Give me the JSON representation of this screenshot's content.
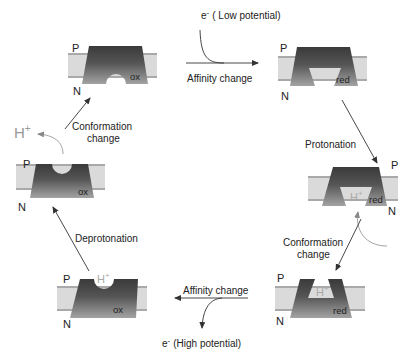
{
  "diagram": {
    "type": "cycle",
    "sides": {
      "top": "P",
      "bottom": "N"
    },
    "states": [
      {
        "id": "s1",
        "redox": "ox",
        "cavity": "open-N",
        "proton": ""
      },
      {
        "id": "s2",
        "redox": "red",
        "cavity": "open-N-wide",
        "proton": ""
      },
      {
        "id": "s3",
        "redox": "red",
        "cavity": "open-N-wide",
        "proton": "H+"
      },
      {
        "id": "s4",
        "redox": "red",
        "cavity": "open-P",
        "proton": "H+"
      },
      {
        "id": "s5",
        "redox": "ox",
        "cavity": "open-P",
        "proton": "H+"
      },
      {
        "id": "s6",
        "redox": "ox",
        "cavity": "open-P",
        "proton": ""
      }
    ],
    "steps": [
      {
        "from": "s1",
        "to": "s2",
        "label": "Affinity change",
        "input": "e⁻ ( Low potential)"
      },
      {
        "from": "s2",
        "to": "s3",
        "label": "Protonation"
      },
      {
        "from": "s3",
        "to": "s4",
        "label_line1": "Conformation",
        "label_line2": "change"
      },
      {
        "from": "s4",
        "to": "s5",
        "label": "Affinity change",
        "output": "e⁻ (High potential)"
      },
      {
        "from": "s5",
        "to": "s6",
        "label": "Deprotonation"
      },
      {
        "from": "s6",
        "to": "s1",
        "label_line1": "Conformation",
        "label_line2": "change",
        "output": "H+"
      }
    ]
  },
  "labels": {
    "P": "P",
    "N": "N",
    "ox": "ox",
    "red": "red",
    "H": "H",
    "plus": "+",
    "e": "e",
    "minus": "-",
    "low_potential": "( Low potential)",
    "high_potential": "(High potential)",
    "affinity_change": "Affinity change",
    "protonation": "Protonation",
    "deprotonation": "Deprotonation",
    "conformation": "Conformation",
    "change": "change"
  },
  "colors": {
    "membrane_band": "#d9d9d9",
    "membrane_line": "#a8a8a8",
    "protein_dark": "#3e3e3e",
    "protein_light": "#9a9a9a",
    "arrow": "#333333",
    "curve_gray": "#999999"
  }
}
